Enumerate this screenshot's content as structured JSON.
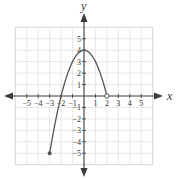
{
  "chart_data": {
    "type": "line",
    "title": "",
    "xlabel": "x",
    "ylabel": "y",
    "xlim": [
      -6,
      6
    ],
    "ylim": [
      -6,
      6
    ],
    "grid": true,
    "x_ticks": [
      -5,
      -4,
      -3,
      -2,
      -1,
      1,
      2,
      3,
      4,
      5
    ],
    "y_ticks": [
      -5,
      -4,
      -3,
      -2,
      -1,
      1,
      2,
      3,
      4,
      5
    ],
    "x_tick_labels": [
      "−5",
      "−4",
      "−3",
      "−2",
      "−1",
      "1",
      "2",
      "3",
      "4",
      "5"
    ],
    "y_tick_labels": [
      "−5",
      "−4",
      "−3",
      "−2",
      "−1",
      "1",
      "2",
      "3",
      "4",
      "5"
    ],
    "series": [
      {
        "name": "f(x)",
        "description": "Parabola y = 4 - x^2 on [-3, 2)",
        "function": "4 - x^2",
        "domain": [
          -3,
          2
        ],
        "points": [
          {
            "x": -3,
            "y": -5
          },
          {
            "x": -2,
            "y": 0
          },
          {
            "x": -1,
            "y": 3
          },
          {
            "x": 0,
            "y": 4
          },
          {
            "x": 1,
            "y": 3
          },
          {
            "x": 2,
            "y": 0
          }
        ],
        "endpoints": [
          {
            "x": -3,
            "y": -5,
            "style": "closed"
          },
          {
            "x": 2,
            "y": 0,
            "style": "open"
          }
        ]
      }
    ],
    "axis_arrows": "both-directions"
  },
  "colors": {
    "axis": "#3a3a3a",
    "grid": "#b9b9b9",
    "curve": "#555555"
  }
}
